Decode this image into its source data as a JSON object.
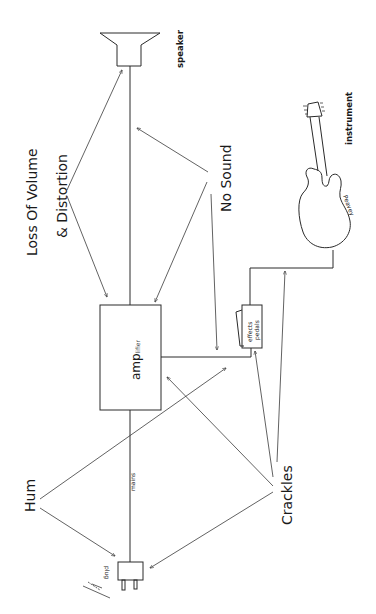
{
  "diagram": {
    "components": {
      "speaker": "speaker",
      "instrument": "instrument",
      "amplifier_main": "amp",
      "amplifier_suffix": "lifier",
      "effects_line1": "effects",
      "effects_line2": "pedals",
      "mains": "mains",
      "plug": "plug",
      "guitar_brand": "Peavey"
    },
    "faults": {
      "loss_of_volume_line1": "Loss Of Volume",
      "loss_of_volume_line2": "& Distortion",
      "no_sound": "No Sound",
      "hum": "Hum",
      "crackles": "Crackles"
    }
  }
}
